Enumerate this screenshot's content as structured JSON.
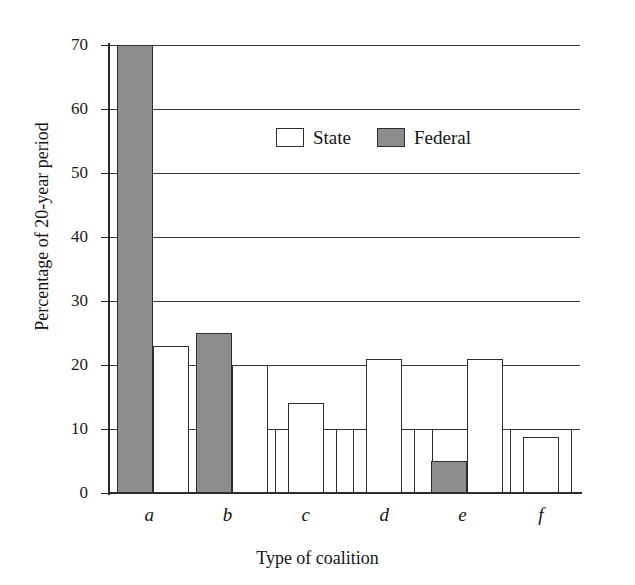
{
  "chart_data": {
    "type": "bar",
    "title": "",
    "subtitle": "",
    "xlabel": "Type of coalition",
    "ylabel": "Percentage of 20-year period",
    "categories": [
      "a",
      "b",
      "c",
      "d",
      "e",
      "f"
    ],
    "ylim": [
      0,
      70
    ],
    "yticks": [
      0,
      10,
      20,
      30,
      40,
      50,
      60,
      70
    ],
    "ytick_labels": [
      "0",
      "10",
      "20",
      "30",
      "40",
      "50",
      "60",
      "70"
    ],
    "grid": true,
    "grid_axis": "y",
    "legend_position": "upper center",
    "series": [
      {
        "name": "State",
        "color": "#ffffff",
        "edge_color": "#2e2e2e",
        "values": [
          23,
          20,
          14,
          21,
          21,
          8.75
        ]
      },
      {
        "name": "Federal",
        "color": "#8d8d8d",
        "edge_color": "#2e2e2e",
        "values": [
          70,
          25,
          0,
          0,
          5,
          0
        ]
      }
    ],
    "baseline_blocks": {
      "note": "wide open blocks drawn to the 10% level behind the main bars",
      "value": 10,
      "spans": [
        "a",
        "b",
        "c",
        "d",
        "e",
        "f"
      ]
    },
    "annotations": []
  },
  "legend": {
    "entries": [
      {
        "label": "State",
        "swatch": "open-square-icon"
      },
      {
        "label": "Federal",
        "swatch": "filled-square-icon"
      }
    ]
  },
  "colors": {
    "federal_fill": "#8d8d8d",
    "state_fill": "#ffffff",
    "outline": "#2e2e2e",
    "axis": "#2a2a2a",
    "background": "#ffffff"
  }
}
